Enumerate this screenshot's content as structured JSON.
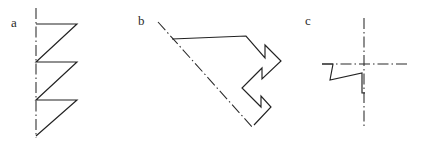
{
  "page": {
    "width": 429,
    "height": 147,
    "background": "#ffffff",
    "stroke_color": "#222222",
    "axis_color": "#2a2a2a",
    "label_color": "#2b2b2b"
  },
  "figures": [
    {
      "id": "a",
      "label": "a",
      "label_x": 11,
      "label_y": 16,
      "description": "sawtooth profile with vertical dash-dot centerline",
      "axis": {
        "type": "dash-dot-line",
        "orientation": "vertical",
        "x1": 36,
        "y1": 8,
        "x2": 36,
        "y2": 138,
        "dash_pattern": "11 3 1.5 3"
      },
      "outline_points": "36,24 77,24 36,62 77,62 36,100 77,100 36,136",
      "teeth": 3
    },
    {
      "id": "b",
      "label": "b",
      "label_x": 138,
      "label_y": 14,
      "description": "stepped polygon with inclined dash-dot axis of symmetry",
      "axis": {
        "type": "dash-dot-line",
        "orientation": "diagonal",
        "x1": 158,
        "y1": 22,
        "x2": 253,
        "y2": 128,
        "dash_pattern": "11 3 1.5 3"
      },
      "outline_points": "172,39 246,36 265,58 265,45 281,61 262,79 262,68 242,88 261,107 261,96 271,107 254,125",
      "steps": 4
    },
    {
      "id": "c",
      "label": "c",
      "label_x": 305,
      "label_y": 14,
      "description": "zigzag profile with crossed vertical and horizontal dash-dot axes",
      "axes": [
        {
          "type": "dash-dot-line",
          "orientation": "vertical",
          "x1": 364,
          "y1": 18,
          "x2": 364,
          "y2": 128,
          "dash_pattern": "11 3 1.5 3"
        },
        {
          "type": "dash-dot-line",
          "orientation": "horizontal",
          "x1": 322,
          "y1": 64,
          "x2": 410,
          "y2": 64,
          "dash_pattern": "11 3 1.5 3"
        }
      ],
      "outline_points": "322,64 333,64 330,80 362,73 362,93 365,93",
      "bends": 4
    }
  ],
  "cropped_caption_fragment": {
    "visible": true,
    "text": "",
    "note": "partial glyph bottoms clipped at top border"
  }
}
